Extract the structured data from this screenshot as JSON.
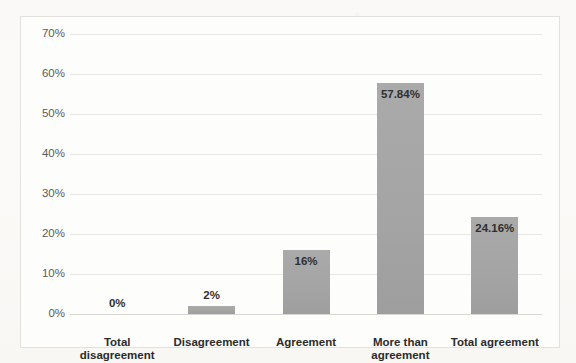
{
  "chart_data": {
    "type": "bar",
    "title": "",
    "xlabel": "",
    "ylabel": "",
    "categories": [
      "Total disagreement",
      "Disagreement",
      "Agreement",
      "More than agreement",
      "Total agreement"
    ],
    "values": [
      0,
      2,
      16,
      57.84,
      24.16
    ],
    "data_labels": [
      "0%",
      "2%",
      "16%",
      "57.84%",
      "24.16%"
    ],
    "ylim": [
      0,
      70
    ],
    "yticks": [
      0,
      10,
      20,
      30,
      40,
      50,
      60,
      70
    ],
    "ytick_labels": [
      "0%",
      "10%",
      "20%",
      "30%",
      "40%",
      "50%",
      "60%",
      "70%"
    ],
    "grid": "horizontal",
    "legend": "none",
    "bar_color": "#a6a6a6",
    "gridline_color": "#e9e7e3",
    "label_color": "#2f2f2f"
  },
  "ghost_title": ""
}
